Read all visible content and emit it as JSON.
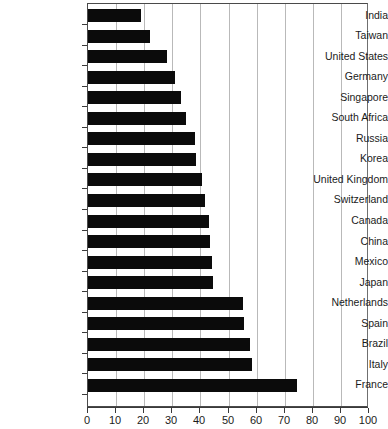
{
  "chart_data": {
    "type": "bar",
    "orientation": "horizontal",
    "title": "",
    "subtitle": "",
    "xlabel": "",
    "ylabel": "",
    "xlim": [
      0,
      100
    ],
    "ylim": null,
    "grid": true,
    "legend": null,
    "legend_position": "none",
    "bar_color": "#0b0b0b",
    "gridline_color": "#b9b9b9",
    "axis_color": "#3a3a3a",
    "x_ticks": [
      0,
      10,
      20,
      30,
      40,
      50,
      60,
      70,
      80,
      90,
      100
    ],
    "x_tick_labels": [
      "0",
      "10",
      "20",
      "30",
      "40",
      "50",
      "60",
      "70",
      "80",
      "90",
      "100"
    ],
    "categories": [
      "India",
      "Taiwan",
      "United States",
      "Germany",
      "Singapore",
      "South Africa",
      "Russia",
      "Korea",
      "United Kingdom",
      "Switzerland",
      "Canada",
      "China",
      "Mexico",
      "Japan",
      "Netherlands",
      "Spain",
      "Brazil",
      "Italy",
      "France"
    ],
    "values": [
      19,
      22,
      28,
      31,
      33,
      35,
      38,
      38.5,
      40.5,
      41.5,
      43,
      43.5,
      44,
      44.5,
      55,
      55.5,
      57.5,
      58.5,
      74.5
    ],
    "annotations": []
  }
}
